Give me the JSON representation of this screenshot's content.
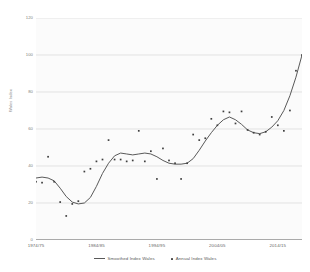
{
  "chart_data": {
    "type": "line",
    "title": "",
    "xlabel": "",
    "ylabel": "Wales Index",
    "ylim": [
      0,
      120
    ],
    "xlim": [
      1974,
      2018
    ],
    "y_ticks": [
      0,
      20,
      40,
      60,
      80,
      100,
      120
    ],
    "x_ticks": [
      "1974/75",
      "1984/85",
      "1994/95",
      "2004/05",
      "2014/15"
    ],
    "x_tick_years": [
      1974,
      1984,
      1994,
      2004,
      2014
    ],
    "grid": "horizontal",
    "legend_position": "bottom",
    "series": [
      {
        "name": "Smoothed Index Wales",
        "type": "line",
        "color": "#595959",
        "x": [
          1974,
          1975,
          1976,
          1977,
          1978,
          1979,
          1980,
          1981,
          1982,
          1983,
          1984,
          1985,
          1986,
          1987,
          1988,
          1989,
          1990,
          1991,
          1992,
          1993,
          1994,
          1995,
          1996,
          1997,
          1998,
          1999,
          2000,
          2001,
          2002,
          2003,
          2004,
          2005,
          2006,
          2007,
          2008,
          2009,
          2010,
          2011,
          2012,
          2013,
          2014,
          2015,
          2016,
          2017,
          2018
        ],
        "values": [
          33.5,
          34.0,
          33.5,
          32.0,
          28.0,
          23.5,
          20.5,
          19.5,
          20.0,
          23.0,
          29.0,
          36.0,
          41.5,
          45.5,
          47.0,
          46.5,
          46.0,
          46.5,
          47.0,
          46.5,
          45.0,
          43.0,
          41.5,
          41.0,
          41.0,
          41.5,
          44.0,
          48.5,
          53.5,
          58.0,
          62.0,
          65.0,
          66.5,
          65.0,
          62.5,
          59.5,
          58.0,
          57.5,
          58.5,
          61.0,
          64.5,
          70.0,
          78.0,
          88.0,
          100.0
        ]
      },
      {
        "name": "Annual Index Wales",
        "type": "scatter",
        "color": "#3f3f3f",
        "x": [
          1974,
          1975,
          1976,
          1977,
          1978,
          1979,
          1980,
          1981,
          1982,
          1983,
          1984,
          1985,
          1986,
          1987,
          1988,
          1989,
          1990,
          1991,
          1992,
          1993,
          1994,
          1995,
          1996,
          1997,
          1998,
          1999,
          2000,
          2001,
          2002,
          2003,
          2004,
          2005,
          2006,
          2007,
          2008,
          2009,
          2010,
          2011,
          2012,
          2013,
          2014,
          2015,
          2016,
          2017,
          2018
        ],
        "values": [
          31.5,
          31.0,
          45.0,
          31.5,
          20.5,
          13.0,
          19.5,
          21.0,
          37.0,
          38.5,
          42.5,
          43.5,
          54.0,
          43.5,
          43.5,
          42.5,
          43.0,
          59.0,
          42.5,
          48.0,
          33.0,
          49.5,
          43.0,
          41.5,
          33.0,
          41.5,
          57.0,
          54.0,
          55.0,
          65.5,
          62.0,
          69.5,
          69.0,
          63.0,
          69.5,
          59.5,
          58.0,
          57.0,
          58.5,
          66.5,
          62.0,
          59.0,
          70.0,
          91.5,
          100.0
        ]
      }
    ]
  },
  "legend": {
    "entries": [
      {
        "label": "Smoothed Index Wales",
        "marker": "line"
      },
      {
        "label": "Annual Index Wales",
        "marker": "dot"
      }
    ]
  },
  "colors": {
    "plot_background": "#fbfbfb",
    "gridline": "#d9d9d9",
    "axis": "#595959",
    "line_series": "#595959",
    "point_series": "#3f3f3f",
    "tick_text": "#808080"
  }
}
